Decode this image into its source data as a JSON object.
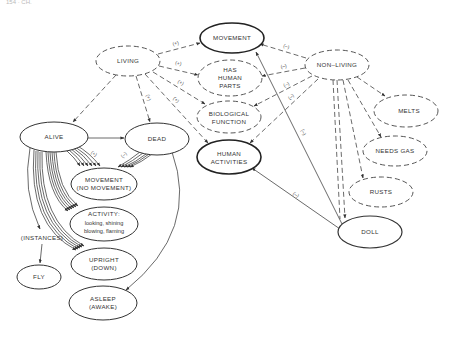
{
  "header": {
    "page_ref": "154 · CH."
  },
  "nodes": {
    "movement_top": {
      "lines": [
        "MOVEMENT"
      ],
      "style": "bold"
    },
    "living": {
      "lines": [
        "LIVING"
      ],
      "style": "dashed"
    },
    "has_human_parts": {
      "lines": [
        "HAS",
        "HUMAN",
        "PARTS"
      ],
      "style": "dashed"
    },
    "non_living": {
      "lines": [
        "NON–LIVING"
      ],
      "style": "dashed"
    },
    "biological_function": {
      "lines": [
        "BIOLOGICAL",
        "FUNCTION"
      ],
      "style": "dashed"
    },
    "human_activities": {
      "lines": [
        "HUMAN",
        "ACTIVITIES"
      ],
      "style": "bold"
    },
    "melts": {
      "lines": [
        "MELTS"
      ],
      "style": "dashed"
    },
    "needs_gas": {
      "lines": [
        "NEEDS GAS"
      ],
      "style": "dashed"
    },
    "rusts": {
      "lines": [
        "RUSTS"
      ],
      "style": "dashed"
    },
    "doll": {
      "lines": [
        "DOLL"
      ],
      "style": "solid"
    },
    "alive": {
      "lines": [
        "ALIVE"
      ],
      "style": "solid"
    },
    "dead": {
      "lines": [
        "DEAD"
      ],
      "style": "solid"
    },
    "movement_sub": {
      "lines": [
        "MOVEMENT",
        "(NO MOVEMENT)"
      ],
      "style": "solid"
    },
    "activity": {
      "lines": [
        "ACTIVITY:",
        "looking, shining",
        "blowing, flaming"
      ],
      "style": "solid"
    },
    "upright": {
      "lines": [
        "UPRIGHT",
        "(DOWN)"
      ],
      "style": "solid"
    },
    "asleep": {
      "lines": [
        "ASLEEP",
        "(AWAKE)"
      ],
      "style": "solid"
    },
    "instances": {
      "lines": [
        "(INSTANCES)"
      ],
      "style": "none"
    },
    "fly": {
      "lines": [
        "FLY"
      ],
      "style": "solid"
    }
  },
  "edge_labels": {
    "living_movement": "(+)",
    "living_has_human_parts": "(+)",
    "living_biological_function": "(+)",
    "living_human_activities": "(+)",
    "living_dead": "(+)",
    "non_living_movement": "(–)",
    "non_living_has_human_parts": "(–)",
    "non_living_biological_function": "(–)",
    "non_living_human_activities": "(–)",
    "doll_movement": "(–)",
    "doll_human_activities": "(–)",
    "alive_movement_sub": "(+)",
    "dead_movement_sub": "(–)"
  }
}
